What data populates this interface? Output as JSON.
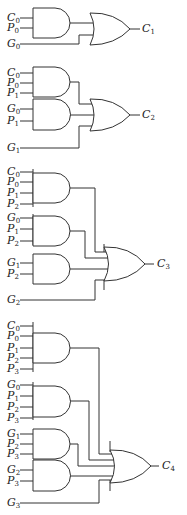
{
  "circuits": [
    {
      "output": "C1",
      "and_gates": [
        {
          "inputs": [
            "C0",
            "P0"
          ]
        }
      ],
      "direct_inputs": [
        "G0"
      ]
    },
    {
      "output": "C2",
      "and_gates": [
        {
          "inputs": [
            "C0",
            "P0",
            "P1"
          ]
        },
        {
          "inputs": [
            "G0",
            "P1"
          ]
        }
      ],
      "direct_inputs": [
        "G1"
      ]
    },
    {
      "output": "C3",
      "and_gates": [
        {
          "inputs": [
            "C0",
            "P0",
            "P1",
            "P2"
          ]
        },
        {
          "inputs": [
            "G0",
            "P1",
            "P2"
          ]
        },
        {
          "inputs": [
            "G1",
            "P2"
          ]
        }
      ],
      "direct_inputs": [
        "G2"
      ]
    },
    {
      "output": "C4",
      "and_gates": [
        {
          "inputs": [
            "C0",
            "P0",
            "P1",
            "P2",
            "P3"
          ]
        },
        {
          "inputs": [
            "G0",
            "P1",
            "P2",
            "P3"
          ]
        },
        {
          "inputs": [
            "G1",
            "P2",
            "P3"
          ]
        },
        {
          "inputs": [
            "G2",
            "P3"
          ]
        }
      ],
      "direct_inputs": [
        "G3"
      ]
    }
  ],
  "labels": {
    "c1": {
      "base": "C",
      "sub": "1"
    },
    "c2": {
      "base": "C",
      "sub": "2"
    },
    "c3": {
      "base": "C",
      "sub": "3"
    },
    "c4": {
      "base": "C",
      "sub": "4"
    }
  },
  "colors": {
    "line": "#333333",
    "background": "#ffffff"
  }
}
